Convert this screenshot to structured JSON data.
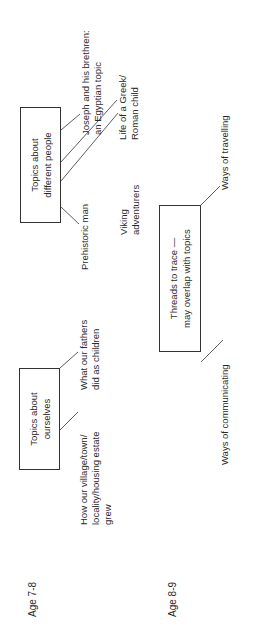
{
  "age_labels": {
    "age_7_8": "Age 7-8",
    "age_8_9": "Age 8-9"
  },
  "row_7_8": {
    "ourselves": {
      "box_label": "Topics about\nourselves",
      "topics": [
        "How our village/town/\nlocality/housing estate\ngrew",
        "What our fathers\ndid as children"
      ]
    },
    "different_people": {
      "box_label": "Topics about\ndifferent people",
      "topics": [
        "Prehistoric man",
        "Viking\nadventurers",
        "Life of a Greek/\nRoman child",
        "Joseph and his brethren:\nan Egyptian topic"
      ]
    }
  },
  "row_8_9": {
    "threads": {
      "box_label": "Threads to trace —\nmay overlap with topics",
      "topics": [
        "Ways of communicating",
        "Ways of travelling"
      ]
    }
  }
}
